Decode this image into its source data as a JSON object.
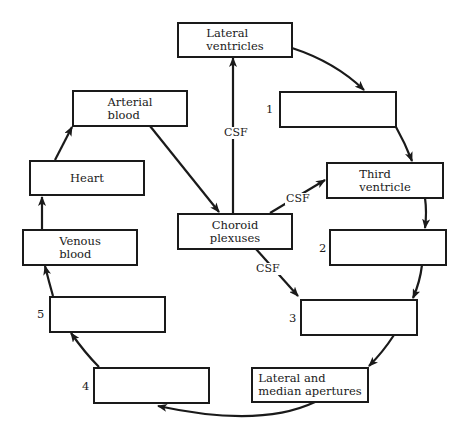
{
  "diagram": {
    "colors": {
      "stroke": "#1a1a1a",
      "background": "#ffffff"
    },
    "boxes": {
      "lateral_ventricles": {
        "lines": [
          "Lateral",
          "ventricles"
        ]
      },
      "blank_1": {
        "number": "1",
        "lines": []
      },
      "third_ventricle": {
        "lines": [
          "Third",
          "ventricle"
        ]
      },
      "blank_2": {
        "number": "2",
        "lines": []
      },
      "blank_3": {
        "number": "3",
        "lines": []
      },
      "apertures": {
        "lines": [
          "Lateral and",
          "median apertures"
        ]
      },
      "blank_4": {
        "number": "4",
        "lines": []
      },
      "blank_5": {
        "number": "5",
        "lines": []
      },
      "venous_blood": {
        "lines": [
          "Venous",
          "blood"
        ]
      },
      "heart": {
        "lines": [
          "Heart"
        ]
      },
      "arterial_blood": {
        "lines": [
          "Arterial",
          "blood"
        ]
      },
      "choroid_plexuses": {
        "lines": [
          "Choroid",
          "plexuses"
        ]
      }
    },
    "arrow_labels": {
      "csf_up": "CSF",
      "csf_right": "CSF",
      "csf_down": "CSF"
    },
    "flow": [
      [
        "Lateral ventricles",
        "1"
      ],
      [
        "1",
        "Third ventricle"
      ],
      [
        "Third ventricle",
        "2"
      ],
      [
        "2",
        "3"
      ],
      [
        "3",
        "Lateral and median apertures"
      ],
      [
        "Lateral and median apertures",
        "4"
      ],
      [
        "4",
        "5"
      ],
      [
        "5",
        "Venous blood"
      ],
      [
        "Venous blood",
        "Heart"
      ],
      [
        "Heart",
        "Arterial blood"
      ],
      [
        "Arterial blood",
        "Choroid plexuses"
      ],
      [
        "Choroid plexuses",
        "Lateral ventricles"
      ],
      [
        "Choroid plexuses",
        "Third ventricle"
      ],
      [
        "Choroid plexuses",
        "3"
      ]
    ]
  }
}
